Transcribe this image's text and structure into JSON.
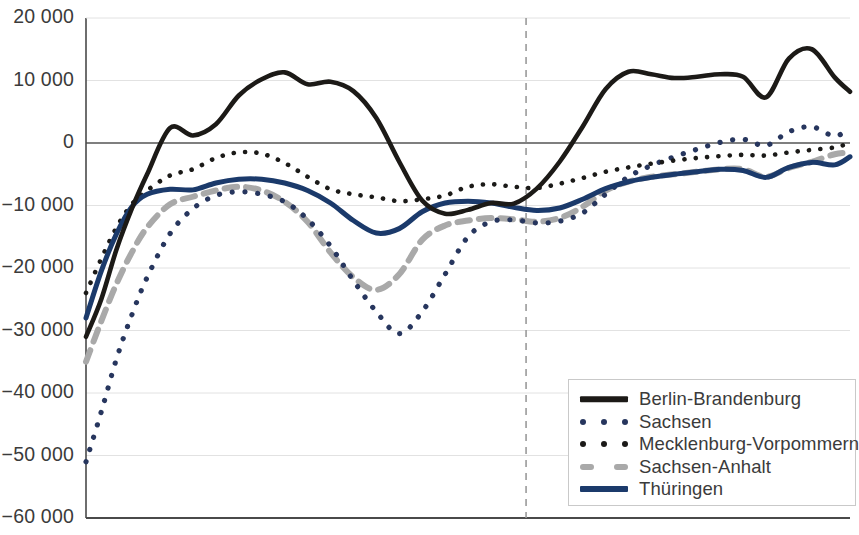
{
  "chart_data": {
    "type": "line",
    "title": "",
    "subtitle": "",
    "xlabel": "",
    "ylabel": "",
    "ylim": [
      -60000,
      20000
    ],
    "ytick_values": [
      20000,
      10000,
      0,
      -10000,
      -20000,
      -30000,
      -40000,
      -50000,
      -60000
    ],
    "ytick_labels": [
      "20 000",
      "10 000",
      "0",
      "−10 000",
      "−20 000",
      "−30 000",
      "−40 000",
      "−50 000",
      "−60 000"
    ],
    "xlim": [
      0,
      100
    ],
    "xtick_labels": [],
    "grid": true,
    "grid_color": "#e2e2e2",
    "zero_line_color": "#555555",
    "axis_color": "#4a4a4a",
    "reference_line": {
      "orientation": "vertical",
      "x": 57.6,
      "style": "dashed",
      "color": "#9a9a9a"
    },
    "legend_position": "bottom-right",
    "series": [
      {
        "name": "Berlin-Brandenburg",
        "color": "#1c1a17",
        "style": "solid",
        "width": 4.6,
        "x": [
          0,
          2,
          4,
          6,
          8,
          11,
          14,
          17,
          20,
          23,
          26,
          29,
          32,
          35,
          38,
          41,
          44,
          47,
          50,
          53,
          56,
          59,
          62,
          65,
          68,
          71,
          74,
          77,
          80,
          83,
          86,
          89,
          92,
          95,
          98,
          100
        ],
        "values": [
          -31000,
          -25000,
          -17000,
          -10500,
          -5000,
          2400,
          1200,
          3000,
          7600,
          10200,
          11300,
          9400,
          9800,
          8300,
          4000,
          -3000,
          -9200,
          -11300,
          -10700,
          -9600,
          -9700,
          -7300,
          -3000,
          2600,
          8600,
          11400,
          11000,
          10400,
          10600,
          11000,
          10600,
          7300,
          13500,
          15000,
          10500,
          8200
        ]
      },
      {
        "name": "Sachsen",
        "color": "#27365e",
        "style": "dotted",
        "width": 5.2,
        "x": [
          0,
          2,
          4,
          6,
          8,
          11,
          14,
          17,
          20,
          23,
          26,
          29,
          32,
          35,
          38,
          41,
          44,
          47,
          50,
          53,
          56,
          59,
          62,
          65,
          68,
          71,
          74,
          77,
          80,
          83,
          86,
          89,
          92,
          95,
          98,
          100
        ],
        "values": [
          -51000,
          -43000,
          -34500,
          -27500,
          -21500,
          -14500,
          -10500,
          -8400,
          -7800,
          -8200,
          -9400,
          -12200,
          -16500,
          -22000,
          -27000,
          -30500,
          -27000,
          -21000,
          -15000,
          -12600,
          -12300,
          -12800,
          -12500,
          -11200,
          -8200,
          -5400,
          -3600,
          -2200,
          -1000,
          100,
          600,
          -400,
          1800,
          2600,
          1100,
          2500
        ]
      },
      {
        "name": "Mecklenburg-Vorpommern",
        "color": "#1b1a18",
        "style": "dotted",
        "width": 4.6,
        "x": [
          0,
          2,
          4,
          6,
          8,
          11,
          14,
          17,
          20,
          23,
          26,
          29,
          32,
          35,
          38,
          41,
          44,
          47,
          50,
          53,
          56,
          59,
          62,
          65,
          68,
          71,
          74,
          77,
          80,
          83,
          86,
          89,
          92,
          95,
          98,
          100
        ],
        "values": [
          -24000,
          -18500,
          -13500,
          -9800,
          -7600,
          -5200,
          -4200,
          -2400,
          -1500,
          -1700,
          -3200,
          -5400,
          -7400,
          -8200,
          -8700,
          -9300,
          -9000,
          -8400,
          -7000,
          -6600,
          -7000,
          -7200,
          -6500,
          -5600,
          -4600,
          -3900,
          -3300,
          -2800,
          -2400,
          -2100,
          -1900,
          -2000,
          -1500,
          -1100,
          -700,
          0
        ]
      },
      {
        "name": "Sachsen-Anhalt",
        "color": "#a9a9a9",
        "style": "dashed",
        "width": 6.0,
        "x": [
          0,
          2,
          4,
          6,
          8,
          11,
          14,
          17,
          20,
          23,
          26,
          29,
          32,
          35,
          38,
          41,
          44,
          47,
          50,
          53,
          56,
          59,
          62,
          65,
          68,
          71,
          74,
          77,
          80,
          83,
          86,
          89,
          92,
          95,
          98,
          100
        ],
        "values": [
          -35000,
          -28500,
          -22500,
          -17500,
          -13500,
          -9800,
          -8600,
          -7600,
          -7000,
          -7600,
          -9400,
          -12600,
          -17500,
          -21500,
          -23500,
          -21000,
          -15500,
          -13200,
          -12400,
          -12000,
          -12200,
          -12600,
          -12000,
          -10200,
          -7600,
          -6200,
          -5400,
          -5000,
          -4600,
          -4200,
          -4200,
          -5400,
          -4000,
          -3000,
          -1800,
          -1500
        ]
      },
      {
        "name": "Thüringen",
        "color": "#1b3a6b",
        "style": "solid",
        "width": 5.0,
        "x": [
          0,
          2,
          4,
          6,
          8,
          11,
          14,
          17,
          20,
          23,
          26,
          29,
          32,
          35,
          38,
          41,
          44,
          47,
          50,
          53,
          56,
          59,
          62,
          65,
          68,
          71,
          74,
          77,
          80,
          83,
          86,
          89,
          92,
          95,
          98,
          100
        ],
        "values": [
          -28000,
          -20500,
          -14500,
          -10200,
          -8200,
          -7400,
          -7500,
          -6400,
          -5800,
          -5800,
          -6400,
          -7600,
          -9600,
          -12400,
          -14400,
          -13700,
          -11000,
          -9600,
          -9300,
          -9600,
          -10300,
          -10800,
          -10400,
          -9000,
          -7300,
          -6200,
          -5500,
          -5000,
          -4600,
          -4200,
          -4400,
          -5500,
          -3900,
          -3100,
          -3500,
          -2200
        ]
      }
    ]
  },
  "legend": {
    "items": [
      {
        "label": "Berlin-Brandenburg",
        "marker": "solid-line-black"
      },
      {
        "label": "Sachsen",
        "marker": "dotted-line-blue"
      },
      {
        "label": "Mecklenburg-Vorpommern",
        "marker": "dotted-line-black"
      },
      {
        "label": "Sachsen-Anhalt",
        "marker": "dashed-line-gray"
      },
      {
        "label": "Thüringen",
        "marker": "solid-line-blue"
      }
    ]
  }
}
